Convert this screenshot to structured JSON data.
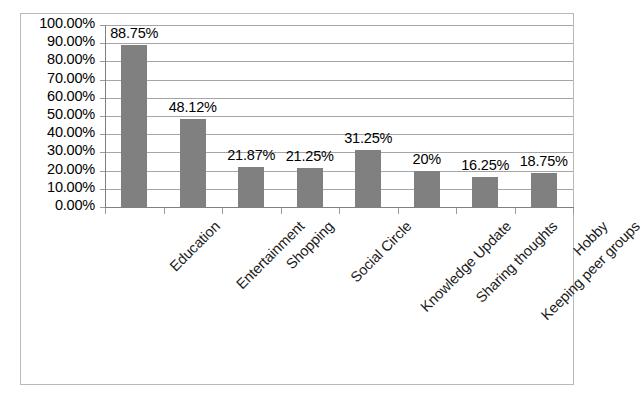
{
  "chart_data": {
    "type": "bar",
    "title": "",
    "xlabel": "",
    "ylabel": "",
    "ylim": [
      0,
      100
    ],
    "grid": true,
    "legend": false,
    "unit": "%",
    "bar_color": "#808080",
    "categories": [
      "Education",
      "Entertainment",
      "Shopping",
      "Social Circle",
      "Knowledge Update",
      "Sharing thoughts",
      "Keeping peer groups",
      "Hobby"
    ],
    "values": [
      88.75,
      48.12,
      21.87,
      21.25,
      31.25,
      20,
      16.25,
      18.75
    ],
    "data_labels": [
      "88.75%",
      "48.12%",
      "21.87%",
      "21.25%",
      "31.25%",
      "20%",
      "16.25%",
      "18.75%"
    ],
    "ytick_labels": [
      "100.00%",
      "90.00%",
      "80.00%",
      "70.00%",
      "60.00%",
      "50.00%",
      "40.00%",
      "30.00%",
      "20.00%",
      "10.00%",
      "0.00%"
    ],
    "ytick_values": [
      100,
      90,
      80,
      70,
      60,
      50,
      40,
      30,
      20,
      10,
      0
    ]
  }
}
